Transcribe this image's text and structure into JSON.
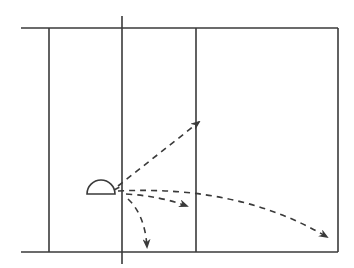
{
  "diagram": {
    "colors": {
      "background": "#ffffff",
      "stroke": "#3a3a3a"
    },
    "court": {
      "top_line": {
        "x1": 21,
        "y1": 28,
        "x2": 338,
        "y2": 28
      },
      "bottom_line": {
        "x1": 21,
        "y1": 252,
        "x2": 338,
        "y2": 252
      },
      "right_line": {
        "x1": 338,
        "y1": 28,
        "x2": 338,
        "y2": 252
      },
      "left_inner_line": {
        "x1": 49,
        "y1": 28,
        "x2": 49,
        "y2": 252
      },
      "center_line": {
        "x1": 122,
        "y1": 16,
        "x2": 122,
        "y2": 264
      },
      "right_inner_line": {
        "x1": 196,
        "y1": 28,
        "x2": 196,
        "y2": 252
      }
    },
    "marker": {
      "shape": "semicircle",
      "cx": 101,
      "base_y": 194,
      "radius": 14
    },
    "trajectories": [
      {
        "name": "up-right",
        "path": "M 118 186 L 199 122"
      },
      {
        "name": "long-arc",
        "path": "M 118 191 Q 240 185 327 237"
      },
      {
        "name": "mid-right",
        "path": "M 126 194 Q 160 196 187 206"
      },
      {
        "name": "down",
        "path": "M 128 199 Q 145 215 147 247"
      },
      {
        "name": "origin-stub",
        "path": "M 114 190 L 120 187"
      }
    ]
  }
}
